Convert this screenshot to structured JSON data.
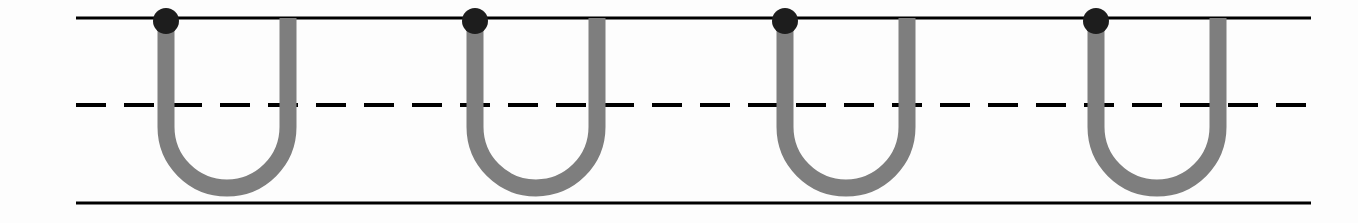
{
  "worksheet": {
    "title": "Letter U Tracing Practice",
    "letter": "U",
    "letter_case": "uppercase",
    "repetitions": 4,
    "background_color": "#fdfdfd",
    "trace_stroke_color": "#7e7e7e",
    "start_dot_color": "#1d1d1d",
    "rule_line_color": "#000000",
    "instruction_text": "",
    "canvas": {
      "width": 1358,
      "height": 223
    }
  },
  "guide_lines": {
    "top_line": {
      "name": "top-rule-line",
      "label": "Top line",
      "y": 18,
      "x_start": 76,
      "x_end": 1311,
      "thickness": 3,
      "style": "solid"
    },
    "mid_line": {
      "name": "mid-dashed-line",
      "label": "Midline (dashed)",
      "y": 105,
      "x_start": 76,
      "x_end": 1311,
      "thickness": 4,
      "style": "dashed",
      "dash_length": 30,
      "dash_gap": 18
    },
    "bottom_line": {
      "name": "baseline-rule-line",
      "label": "Baseline",
      "y": 203,
      "x_start": 76,
      "x_end": 1311,
      "thickness": 3,
      "style": "solid"
    }
  },
  "letter_glyphs": [
    {
      "index": 1,
      "character": "U",
      "left_stem_x": 166,
      "right_stem_x": 288,
      "top_y": 18,
      "bottom_y": 188,
      "stroke_width": 17,
      "start_dot": {
        "cx": 166,
        "cy": 21,
        "r": 13
      }
    },
    {
      "index": 2,
      "character": "U",
      "left_stem_x": 475,
      "right_stem_x": 597,
      "top_y": 18,
      "bottom_y": 188,
      "stroke_width": 17,
      "start_dot": {
        "cx": 475,
        "cy": 21,
        "r": 13
      }
    },
    {
      "index": 3,
      "character": "U",
      "left_stem_x": 785,
      "right_stem_x": 907,
      "top_y": 18,
      "bottom_y": 188,
      "stroke_width": 17,
      "start_dot": {
        "cx": 785,
        "cy": 21,
        "r": 13
      }
    },
    {
      "index": 4,
      "character": "U",
      "left_stem_x": 1096,
      "right_stem_x": 1218,
      "top_y": 18,
      "bottom_y": 188,
      "stroke_width": 17,
      "start_dot": {
        "cx": 1096,
        "cy": 21,
        "r": 13
      }
    }
  ]
}
